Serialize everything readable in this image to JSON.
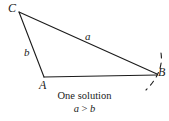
{
  "figure": {
    "kind": "triangle-ambiguous-case-diagram",
    "background_color": "#ffffff",
    "stroke_color": "#1b1b1b",
    "vertices": {
      "C": {
        "label": "C",
        "x": 19,
        "y": 12,
        "label_x": 8,
        "label_y": 2
      },
      "A": {
        "label": "A",
        "x": 44,
        "y": 77,
        "label_x": 39,
        "label_y": 79
      },
      "B": {
        "label": "B",
        "x": 157,
        "y": 74,
        "label_x": 157,
        "label_y": 66
      }
    },
    "sides": [
      {
        "name": "a",
        "label": "a",
        "from": "C",
        "to": "B",
        "label_x": 84,
        "label_y": 32
      },
      {
        "name": "b",
        "label": "b",
        "from": "C",
        "to": "A",
        "label_x": 24,
        "label_y": 47
      },
      {
        "name": "c",
        "label": "",
        "from": "A",
        "to": "B",
        "label_x": 0,
        "label_y": 0
      }
    ],
    "arc": {
      "description": "dashed arc of radius a swung from C through B",
      "dashed": true
    },
    "caption": {
      "line1": "One solution",
      "line2_lhs": "a",
      "line2_op": ">",
      "line2_rhs": "b"
    }
  }
}
